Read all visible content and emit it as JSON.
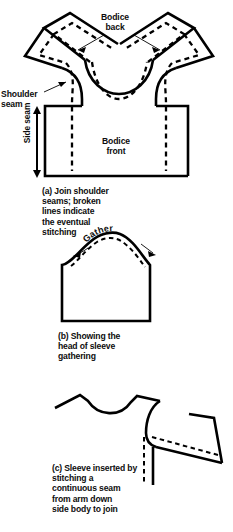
{
  "document": {
    "type": "instructional-sewing-diagram",
    "subject": "Bodice and sleeve assembly",
    "ink_color": "#000000",
    "background_color": "#ffffff"
  },
  "figures": [
    {
      "id": "a",
      "name": "join-shoulder-seams",
      "caption": "(a) Join shoulder\nseams; broken\nlines indicate\nthe eventual\nstitching",
      "labels": {
        "bodice_back": "Bodice\nback",
        "bodice_front": "Bodice\nfront",
        "shoulder_seam": "Shoulder\nseam",
        "side_seam": "Side seam"
      }
    },
    {
      "id": "b",
      "name": "sleeve-head-gathering",
      "caption": "(b) Showing the\nhead of sleeve\ngathering",
      "labels": {
        "gather": "Gather"
      }
    },
    {
      "id": "c",
      "name": "sleeve-inserted-continuous-seam",
      "caption": "(c) Sleeve inserted by\nstitching a\ncontinuous seam\nfrom arm down\nside body to join",
      "labels": {}
    }
  ],
  "bottom_edge_partial_text": " "
}
